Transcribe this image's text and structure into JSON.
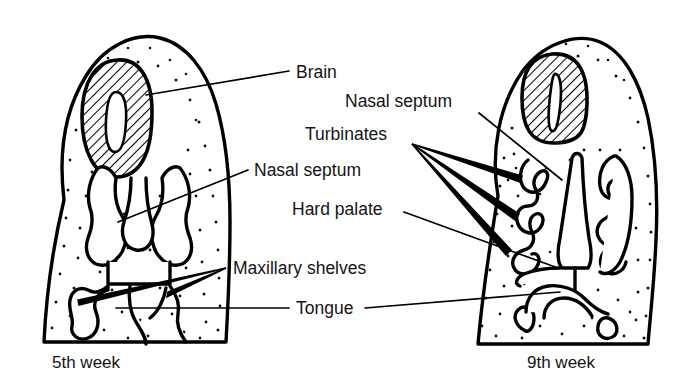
{
  "figure": {
    "type": "anatomical-diagram",
    "background_color": "#ffffff",
    "ink_color": "#000000",
    "text_color": "#141414",
    "panels": [
      {
        "id": "left-panel",
        "caption": "5th week",
        "caption_x": 52,
        "caption_y": 368
      },
      {
        "id": "right-panel",
        "caption": "9th week",
        "caption_x": 527,
        "caption_y": 368
      }
    ],
    "labels": [
      {
        "id": "brain",
        "text": "Brain",
        "x": 296,
        "y": 78,
        "anchor": "start",
        "target_panel": "left-panel",
        "leader": "M 289 71 L 146 95"
      },
      {
        "id": "nasal-septum-right",
        "text": "Nasal septum",
        "x": 345,
        "y": 107,
        "anchor": "start",
        "target_panel": "right-panel",
        "leader": "M 479 113 L 562 180"
      },
      {
        "id": "turbinates",
        "text": "Turbinates",
        "x": 305,
        "y": 140,
        "anchor": "start",
        "target_panel": "right-panel",
        "leader_fan_tip_x": 412,
        "leader_fan_tip_y": 144,
        "leader_fan_targets": [
          [
            520,
            178
          ],
          [
            516,
            218
          ],
          [
            508,
            254
          ]
        ]
      },
      {
        "id": "nasal-septum-left",
        "text": "Nasal septum",
        "x": 254,
        "y": 176,
        "anchor": "start",
        "target_panel": "left-panel",
        "leader": "M 248 170 L 118 222"
      },
      {
        "id": "hard-palate",
        "text": "Hard palate",
        "x": 292,
        "y": 215,
        "anchor": "start",
        "target_panel": "right-panel",
        "leader": "M 404 212 L 556 268"
      },
      {
        "id": "maxillary-shelves",
        "text": "Maxillary shelves",
        "x": 233,
        "y": 274,
        "anchor": "start",
        "target_panel": "left-panel",
        "leader_fan_tip_x": 226,
        "leader_fan_tip_y": 268,
        "leader_fan_targets": [
          [
            76,
            302
          ],
          [
            166,
            295
          ]
        ]
      },
      {
        "id": "tongue",
        "text": "Tongue",
        "x": 296,
        "y": 314,
        "anchor": "start",
        "target_panel": "both",
        "leader_left": "M 289 308 L 116 308",
        "leader_right": "M 365 308 L 560 292"
      }
    ],
    "structures": {
      "left": {
        "head_outline": "developing head, 5th week",
        "brain": "hatched oval with slit ventricle",
        "nasal_cavity": "paired nasal pits",
        "nasal_septum": "central vertical ridge",
        "maxillary_shelves": "vertical palatal shelves flanking the tongue",
        "tongue": "central mass between shelves"
      },
      "right": {
        "head_outline": "developing head, 9th week",
        "brain": "hatched rounded rectangle with narrow slit ventricle",
        "nasal_septum": "central descending column reaching palate",
        "turbinates": "three scroll-like shelves on each lateral wall",
        "hard_palate": "fused horizontal palate",
        "tongue": "arch-shaped mass below palate"
      }
    }
  }
}
